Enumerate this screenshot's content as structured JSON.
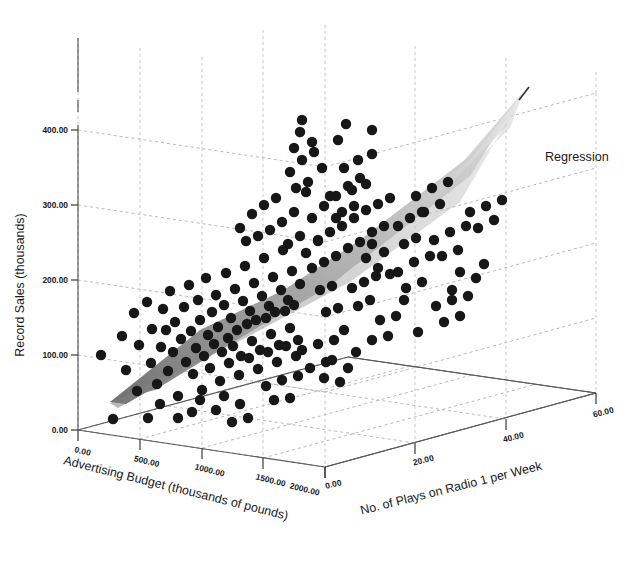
{
  "figure": {
    "background_color": "#ffffff",
    "point_color": "#171717",
    "grid_color": "#bdbdbd",
    "axis_color": "#4a4a4a",
    "plane_color_near": "#8c8c8c",
    "plane_color_far": "#dedede"
  },
  "legend": {
    "position": "right",
    "entries": [
      {
        "label": "Regression",
        "type": "surface"
      }
    ],
    "regression_label": "Regression"
  },
  "chart_data": {
    "type": "scatter",
    "dimensions": "3d",
    "title": "",
    "xlabel": "Advertising Budget (thousands of pounds)",
    "ylabel": "Record Sales (thousands)",
    "zlabel": "No. of Plays on Radio 1 per Week",
    "grid": true,
    "legend_position": "right",
    "xlim": [
      0,
      2000
    ],
    "ylim": [
      0,
      400
    ],
    "zlim": [
      0,
      60
    ],
    "xticks": [
      "0.00",
      "500.00",
      "1000.00",
      "1500.00",
      "2000.00"
    ],
    "xtick_values": [
      0,
      500,
      1000,
      1500,
      2000
    ],
    "yticks": [
      "0.00",
      "100.00",
      "200.00",
      "300.00",
      "400.00"
    ],
    "ytick_values": [
      0,
      100,
      200,
      300,
      400
    ],
    "zticks": [
      "0.00",
      "20.00",
      "40.00",
      "60.00"
    ],
    "ztick_values": [
      0,
      20,
      40,
      60
    ],
    "surface": {
      "name": "Regression",
      "description": "Least-squares regression plane of record sales on advertising budget and radio plays"
    },
    "series": [
      {
        "name": "Record sales observations",
        "marker": "filled-circle",
        "color": "#171717",
        "n_points": 200,
        "points_px": [
          [
            101,
            355
          ],
          [
            113,
            419
          ],
          [
            122,
            336
          ],
          [
            126,
            370
          ],
          [
            134,
            313
          ],
          [
            137,
            391
          ],
          [
            139,
            345
          ],
          [
            147,
            302
          ],
          [
            151,
            363
          ],
          [
            152,
            329
          ],
          [
            157,
            384
          ],
          [
            161,
            347
          ],
          [
            163,
            309
          ],
          [
            166,
            330
          ],
          [
            168,
            371
          ],
          [
            170,
            291
          ],
          [
            173,
            352
          ],
          [
            175,
            322
          ],
          [
            178,
            396
          ],
          [
            181,
            339
          ],
          [
            184,
            307
          ],
          [
            186,
            362
          ],
          [
            189,
            285
          ],
          [
            191,
            331
          ],
          [
            193,
            374
          ],
          [
            196,
            348
          ],
          [
            198,
            300
          ],
          [
            200,
            320
          ],
          [
            202,
            390
          ],
          [
            204,
            356
          ],
          [
            206,
            278
          ],
          [
            208,
            335
          ],
          [
            210,
            368
          ],
          [
            212,
            312
          ],
          [
            214,
            344
          ],
          [
            216,
            295
          ],
          [
            218,
            327
          ],
          [
            220,
            381
          ],
          [
            222,
            352
          ],
          [
            224,
            305
          ],
          [
            226,
            273
          ],
          [
            228,
            338
          ],
          [
            229,
            363
          ],
          [
            231,
            318
          ],
          [
            233,
            346
          ],
          [
            235,
            289
          ],
          [
            237,
            330
          ],
          [
            239,
            375
          ],
          [
            241,
            356
          ],
          [
            243,
            301
          ],
          [
            245,
            266
          ],
          [
            247,
            324
          ],
          [
            249,
            358
          ],
          [
            250,
            311
          ],
          [
            252,
            341
          ],
          [
            254,
            283
          ],
          [
            256,
            320
          ],
          [
            258,
            369
          ],
          [
            260,
            350
          ],
          [
            262,
            296
          ],
          [
            264,
            258
          ],
          [
            266,
            318
          ],
          [
            268,
            352
          ],
          [
            269,
            306
          ],
          [
            271,
            334
          ],
          [
            273,
            277
          ],
          [
            275,
            312
          ],
          [
            277,
            362
          ],
          [
            279,
            345
          ],
          [
            281,
            290
          ],
          [
            283,
            250
          ],
          [
            285,
            311
          ],
          [
            286,
            346
          ],
          [
            288,
            300
          ],
          [
            290,
            328
          ],
          [
            292,
            271
          ],
          [
            294,
            305
          ],
          [
            296,
            356
          ],
          [
            298,
            340
          ],
          [
            300,
            284
          ],
          [
            240,
            228
          ],
          [
            246,
            241
          ],
          [
            252,
            214
          ],
          [
            258,
            236
          ],
          [
            264,
            205
          ],
          [
            270,
            230
          ],
          [
            276,
            198
          ],
          [
            282,
            222
          ],
          [
            288,
            244
          ],
          [
            294,
            212
          ],
          [
            300,
            236
          ],
          [
            306,
            192
          ],
          [
            312,
            218
          ],
          [
            318,
            241
          ],
          [
            324,
            206
          ],
          [
            290,
            172
          ],
          [
            296,
            188
          ],
          [
            302,
            160
          ],
          [
            308,
            182
          ],
          [
            314,
            152
          ],
          [
            302,
            120
          ],
          [
            312,
            142
          ],
          [
            322,
            168
          ],
          [
            330,
            196
          ],
          [
            336,
            218
          ],
          [
            306,
            253
          ],
          [
            312,
            268
          ],
          [
            318,
            240
          ],
          [
            324,
            262
          ],
          [
            330,
            232
          ],
          [
            336,
            256
          ],
          [
            342,
            226
          ],
          [
            348,
            248
          ],
          [
            354,
            218
          ],
          [
            360,
            242
          ],
          [
            336,
            196
          ],
          [
            342,
            212
          ],
          [
            348,
            186
          ],
          [
            354,
            206
          ],
          [
            360,
            178
          ],
          [
            344,
            168
          ],
          [
            352,
            190
          ],
          [
            358,
            160
          ],
          [
            366,
            184
          ],
          [
            372,
            154
          ],
          [
            366,
            210
          ],
          [
            372,
            232
          ],
          [
            378,
            204
          ],
          [
            384,
            226
          ],
          [
            390,
            198
          ],
          [
            366,
            258
          ],
          [
            372,
            244
          ],
          [
            378,
            268
          ],
          [
            384,
            252
          ],
          [
            390,
            274
          ],
          [
            352,
            288
          ],
          [
            358,
            306
          ],
          [
            364,
            282
          ],
          [
            370,
            300
          ],
          [
            376,
            276
          ],
          [
            320,
            290
          ],
          [
            326,
            312
          ],
          [
            332,
            286
          ],
          [
            338,
            308
          ],
          [
            344,
            330
          ],
          [
            302,
            350
          ],
          [
            310,
            368
          ],
          [
            318,
            344
          ],
          [
            326,
            362
          ],
          [
            334,
            340
          ],
          [
            266,
            386
          ],
          [
            274,
            400
          ],
          [
            282,
            380
          ],
          [
            290,
            398
          ],
          [
            298,
            376
          ],
          [
            240,
            404
          ],
          [
            248,
            418
          ],
          [
            216,
            410
          ],
          [
            224,
            396
          ],
          [
            232,
            422
          ],
          [
            192,
            412
          ],
          [
            200,
            400
          ],
          [
            178,
            418
          ],
          [
            160,
            404
          ],
          [
            148,
            418
          ],
          [
            398,
            226
          ],
          [
            404,
            244
          ],
          [
            410,
            218
          ],
          [
            416,
            238
          ],
          [
            422,
            212
          ],
          [
            398,
            272
          ],
          [
            406,
            288
          ],
          [
            414,
            262
          ],
          [
            422,
            282
          ],
          [
            430,
            256
          ],
          [
            416,
            196
          ],
          [
            424,
            212
          ],
          [
            432,
            188
          ],
          [
            440,
            204
          ],
          [
            448,
            182
          ],
          [
            434,
            240
          ],
          [
            442,
            256
          ],
          [
            450,
            232
          ],
          [
            458,
            250
          ],
          [
            466,
            226
          ],
          [
            452,
            290
          ],
          [
            460,
            272
          ],
          [
            468,
            296
          ],
          [
            476,
            278
          ],
          [
            484,
            264
          ],
          [
            470,
            212
          ],
          [
            478,
            228
          ],
          [
            486,
            206
          ],
          [
            494,
            220
          ],
          [
            502,
            200
          ],
          [
            436,
            306
          ],
          [
            444,
            322
          ],
          [
            452,
            300
          ],
          [
            460,
            316
          ],
          [
            418,
            332
          ],
          [
            404,
            300
          ],
          [
            396,
            316
          ],
          [
            388,
            336
          ],
          [
            380,
            320
          ],
          [
            372,
            340
          ],
          [
            356,
            352
          ],
          [
            348,
            368
          ],
          [
            340,
            382
          ],
          [
            332,
            360
          ],
          [
            324,
            378
          ],
          [
            294,
            148
          ],
          [
            300,
            132
          ],
          [
            338,
            140
          ],
          [
            346,
            124
          ],
          [
            372,
            130
          ]
        ]
      }
    ]
  },
  "axes": {
    "y_axis": {
      "title": "Record Sales (thousands)",
      "tick_labels": [
        "400.00",
        "300.00",
        "200.00",
        "100.00",
        "0.00"
      ]
    },
    "x_axis": {
      "title": "Advertising Budget (thousands of pounds)",
      "tick_labels": [
        "0.00",
        "500.00",
        "1000.00",
        "1500.00",
        "2000.00"
      ]
    },
    "z_axis": {
      "title": "No. of Plays on Radio 1 per Week",
      "tick_labels": [
        "0.00",
        "20.00",
        "40.00",
        "60.00"
      ]
    }
  }
}
